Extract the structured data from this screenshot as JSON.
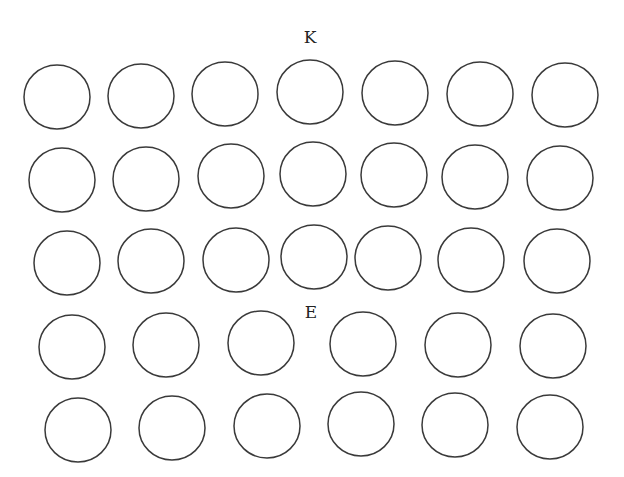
{
  "diagram": {
    "labels": [
      {
        "id": "K",
        "text": "K",
        "x": 310,
        "y": 43
      },
      {
        "id": "E",
        "text": "E",
        "x": 311,
        "y": 318
      }
    ],
    "stroke_color": "#3a3a3a",
    "background": "#ffffff",
    "rows": [
      {
        "name": "row-1",
        "circles": [
          {
            "cx": 57,
            "cy": 97,
            "rx": 33,
            "ry": 32
          },
          {
            "cx": 141,
            "cy": 96,
            "rx": 33,
            "ry": 32
          },
          {
            "cx": 225,
            "cy": 94,
            "rx": 33,
            "ry": 32
          },
          {
            "cx": 310,
            "cy": 92,
            "rx": 33,
            "ry": 32
          },
          {
            "cx": 395,
            "cy": 93,
            "rx": 33,
            "ry": 32
          },
          {
            "cx": 480,
            "cy": 94,
            "rx": 33,
            "ry": 32
          },
          {
            "cx": 565,
            "cy": 95,
            "rx": 33,
            "ry": 32
          }
        ]
      },
      {
        "name": "row-2",
        "circles": [
          {
            "cx": 62,
            "cy": 180,
            "rx": 33,
            "ry": 32
          },
          {
            "cx": 146,
            "cy": 179,
            "rx": 33,
            "ry": 32
          },
          {
            "cx": 231,
            "cy": 176,
            "rx": 33,
            "ry": 32
          },
          {
            "cx": 313,
            "cy": 174,
            "rx": 33,
            "ry": 32
          },
          {
            "cx": 394,
            "cy": 175,
            "rx": 33,
            "ry": 32
          },
          {
            "cx": 475,
            "cy": 177,
            "rx": 33,
            "ry": 32
          },
          {
            "cx": 560,
            "cy": 178,
            "rx": 33,
            "ry": 32
          }
        ]
      },
      {
        "name": "row-3",
        "circles": [
          {
            "cx": 67,
            "cy": 263,
            "rx": 33,
            "ry": 32
          },
          {
            "cx": 151,
            "cy": 261,
            "rx": 33,
            "ry": 32
          },
          {
            "cx": 236,
            "cy": 260,
            "rx": 33,
            "ry": 32
          },
          {
            "cx": 314,
            "cy": 257,
            "rx": 33,
            "ry": 32
          },
          {
            "cx": 388,
            "cy": 258,
            "rx": 33,
            "ry": 32
          },
          {
            "cx": 471,
            "cy": 260,
            "rx": 33,
            "ry": 32
          },
          {
            "cx": 557,
            "cy": 261,
            "rx": 33,
            "ry": 32
          }
        ]
      },
      {
        "name": "row-4",
        "circles": [
          {
            "cx": 72,
            "cy": 347,
            "rx": 33,
            "ry": 32
          },
          {
            "cx": 166,
            "cy": 345,
            "rx": 33,
            "ry": 32
          },
          {
            "cx": 261,
            "cy": 343,
            "rx": 33,
            "ry": 32
          },
          {
            "cx": 363,
            "cy": 344,
            "rx": 33,
            "ry": 32
          },
          {
            "cx": 458,
            "cy": 345,
            "rx": 33,
            "ry": 32
          },
          {
            "cx": 553,
            "cy": 346,
            "rx": 33,
            "ry": 32
          }
        ]
      },
      {
        "name": "row-5",
        "circles": [
          {
            "cx": 78,
            "cy": 430,
            "rx": 33,
            "ry": 32
          },
          {
            "cx": 172,
            "cy": 428,
            "rx": 33,
            "ry": 32
          },
          {
            "cx": 267,
            "cy": 426,
            "rx": 33,
            "ry": 32
          },
          {
            "cx": 361,
            "cy": 424,
            "rx": 33,
            "ry": 32
          },
          {
            "cx": 455,
            "cy": 425,
            "rx": 33,
            "ry": 32
          },
          {
            "cx": 550,
            "cy": 427,
            "rx": 33,
            "ry": 32
          }
        ]
      }
    ]
  }
}
